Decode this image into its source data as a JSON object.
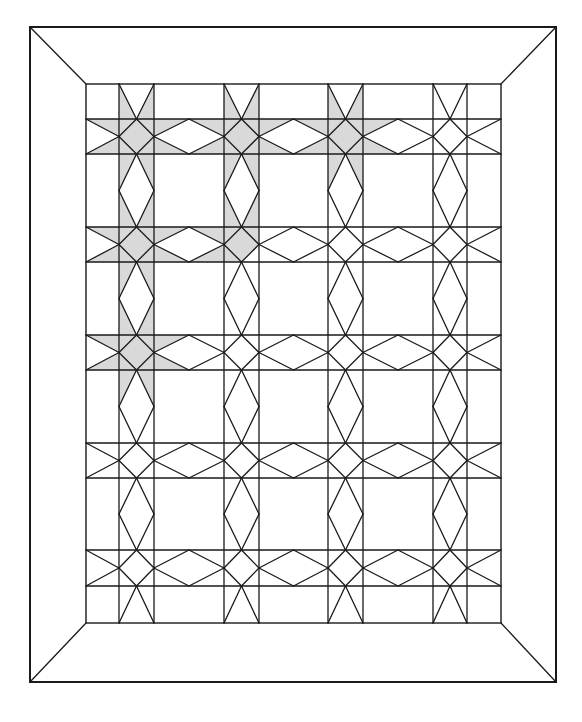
{
  "colors": {
    "line": "#1a1a1a",
    "shade": "#d9d9d9",
    "background": "#ffffff"
  },
  "quilt": {
    "outer_frame": {
      "x1": 30,
      "y1": 27,
      "x2": 556,
      "y2": 682
    },
    "inner_frame": {
      "x1": 86,
      "y1": 84,
      "x2": 501,
      "y2": 623
    },
    "columns": [
      [
        119,
        154
      ],
      [
        224,
        259
      ],
      [
        328,
        363
      ],
      [
        433,
        467
      ]
    ],
    "rows": [
      [
        119,
        154
      ],
      [
        227,
        262
      ],
      [
        335,
        370
      ],
      [
        443,
        478
      ],
      [
        550,
        586
      ]
    ],
    "shading": {
      "full_stars": [
        [
          0,
          0
        ],
        [
          0,
          1
        ],
        [
          0,
          2
        ],
        [
          1,
          0
        ],
        [
          2,
          0
        ]
      ],
      "partial_stars": [
        {
          "row": 1,
          "col": 1,
          "parts": [
            "top",
            "left",
            "center",
            "top-left",
            "top-right"
          ]
        }
      ],
      "sashing_h": [
        {
          "row": 0,
          "between": [
            0,
            1
          ]
        },
        {
          "row": 0,
          "between": [
            1,
            2
          ]
        },
        {
          "row": 1,
          "between": [
            0,
            1
          ]
        },
        {
          "row": 2,
          "between": [
            0,
            1
          ],
          "half": "left"
        },
        {
          "row": 0,
          "between": [
            2,
            3
          ],
          "half": "left"
        }
      ],
      "sashing_v": [
        {
          "col": 0,
          "between": [
            0,
            1
          ]
        },
        {
          "col": 0,
          "between": [
            1,
            2
          ]
        },
        {
          "col": 1,
          "between": [
            0,
            1
          ]
        },
        {
          "col": 0,
          "between": [
            2,
            3
          ],
          "half": "top"
        },
        {
          "col": 2,
          "between": [
            0,
            1
          ],
          "half": "top"
        }
      ],
      "edge_h": [
        {
          "row": 0,
          "side": "left"
        },
        {
          "row": 1,
          "side": "left"
        },
        {
          "row": 2,
          "side": "left"
        }
      ],
      "edge_v": [
        {
          "col": 0,
          "side": "top"
        },
        {
          "col": 1,
          "side": "top"
        },
        {
          "col": 2,
          "side": "top"
        }
      ]
    }
  }
}
